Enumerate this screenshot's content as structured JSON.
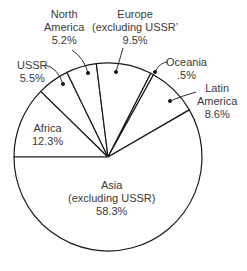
{
  "chart_data": {
    "type": "pie",
    "title": "",
    "start_angle_deg": 180,
    "direction": "clockwise",
    "slices": [
      {
        "name": "Africa",
        "lines": [
          "Africa",
          "12.3%"
        ],
        "value": 12.3
      },
      {
        "name": "USSR",
        "lines": [
          "USSR",
          "5.5%"
        ],
        "value": 5.5
      },
      {
        "name": "North America",
        "lines": [
          "North",
          "America",
          "5.2%"
        ],
        "value": 5.2
      },
      {
        "name": "Europe (excluding USSR)",
        "lines": [
          "Europe",
          "(excluding USSR)",
          "9.5%"
        ],
        "value": 9.5
      },
      {
        "name": "Oceania",
        "lines": [
          "Oceania",
          ".5%"
        ],
        "value": 0.5
      },
      {
        "name": "Latin America",
        "lines": [
          "Latin",
          "America",
          "8.6%"
        ],
        "value": 8.6
      },
      {
        "name": "Asia (excluding USSR)",
        "lines": [
          "Asia",
          "(excluding USSR)",
          "58.3%"
        ],
        "value": 58.3
      }
    ],
    "colors": {
      "fill": "#ffffff",
      "stroke": "#1a1a1a",
      "text": "#3a3a3a"
    }
  },
  "labels": {
    "africa": {
      "l1": "Africa",
      "l2": "12.3%"
    },
    "ussr": {
      "l1": "USSR",
      "l2": "5.5%"
    },
    "north_america": {
      "l1": "North",
      "l2": "America",
      "l3": "5.2%"
    },
    "europe": {
      "l1": "Europe",
      "l2": "(excluding USSR’",
      "l3": "9.5%"
    },
    "oceania": {
      "l1": "Oceania",
      "l2": ".5%"
    },
    "latin_america": {
      "l1": "Latin",
      "l2": "America",
      "l3": "8.6%"
    },
    "asia": {
      "l1": "Asia",
      "l2": "(excluding USSR)",
      "l3": "58.3%"
    }
  }
}
